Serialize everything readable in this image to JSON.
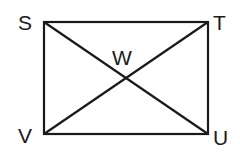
{
  "diagram": {
    "type": "rectangle-with-diagonals",
    "vertices": {
      "top_left": "S",
      "top_right": "T",
      "bottom_right": "U",
      "bottom_left": "V"
    },
    "intersection": "W",
    "segments": [
      "ST",
      "TU",
      "UV",
      "VS",
      "SU",
      "TV"
    ],
    "line_color": "#1a1a1a",
    "background": "#ffffff"
  }
}
